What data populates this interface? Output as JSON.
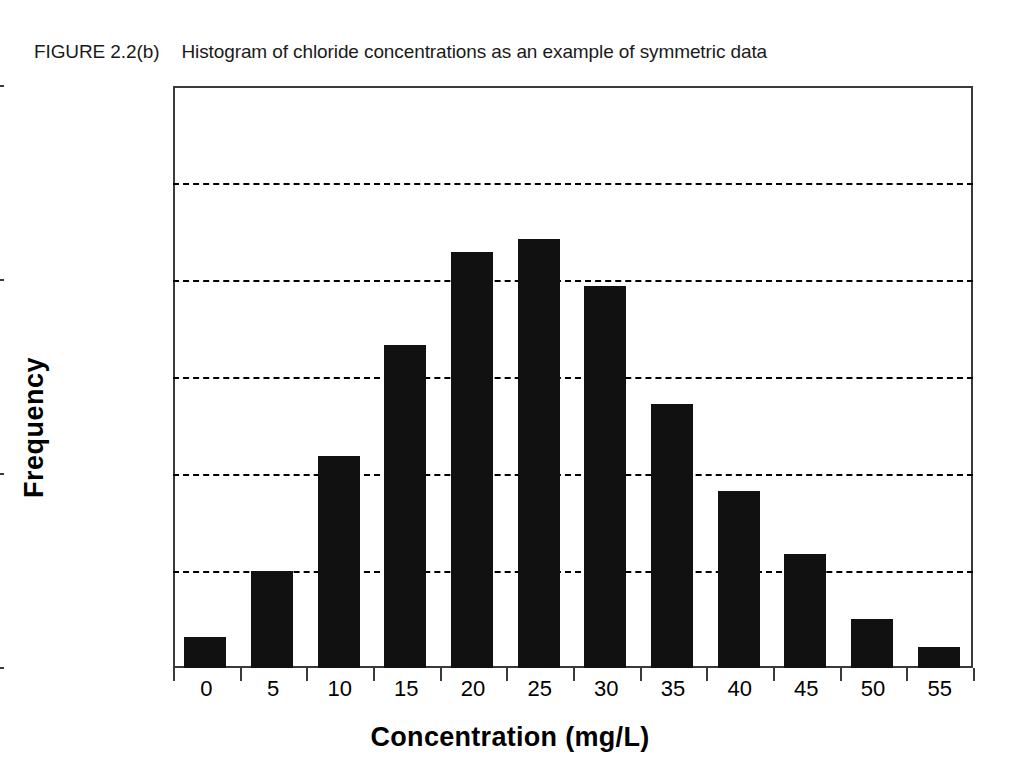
{
  "figure": {
    "label": "FIGURE 2.2(b)",
    "caption": "Histogram of chloride concentrations as an example of symmetric data"
  },
  "chart_data": {
    "type": "bar",
    "title": "Histogram of chloride concentrations as an example of symmetric data",
    "xlabel": "Concentration (mg/L)",
    "ylabel": "Frequency",
    "categories": [
      "0",
      "5",
      "10",
      "15",
      "20",
      "25",
      "30",
      "35",
      "40",
      "45",
      "50",
      "55"
    ],
    "values": [
      3.2,
      10.0,
      21.9,
      33.3,
      42.9,
      44.2,
      39.4,
      27.2,
      18.3,
      11.8,
      5.1,
      2.2
    ],
    "ylim": [
      0,
      60
    ],
    "xlim": [
      0,
      60
    ],
    "ytick_labels": [
      "0.00",
      "20.00",
      "40.00",
      "60.00"
    ],
    "ytick_values": [
      0,
      20,
      40,
      60
    ],
    "minor_gridline_values": [
      10,
      30,
      50
    ],
    "grid": true,
    "legend": "none",
    "bar_color": "#111111"
  }
}
